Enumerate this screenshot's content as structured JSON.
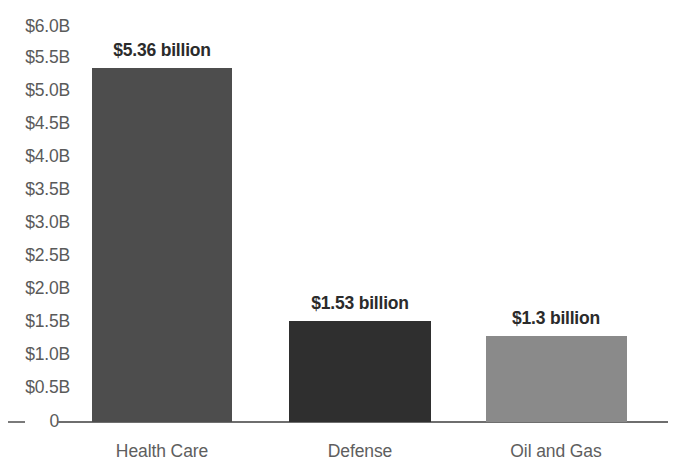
{
  "chart_data": {
    "type": "bar",
    "title": "",
    "xlabel": "",
    "ylabel": "",
    "categories": [
      "Health Care",
      "Defense",
      "Oil and Gas"
    ],
    "values": [
      5.36,
      1.53,
      1.3
    ],
    "value_labels": [
      "$5.36 billion",
      "$1.53 billion",
      "$1.3 billion"
    ],
    "bar_colors": [
      "#4d4d4d",
      "#2f2f2f",
      "#8a8a8a"
    ],
    "ylim": [
      0,
      6.0
    ],
    "ytick_values": [
      6.0,
      5.5,
      5.0,
      4.5,
      4.0,
      3.5,
      3.0,
      2.5,
      2.0,
      1.5,
      1.0,
      0.5,
      0
    ],
    "ytick_labels": [
      "$6.0B",
      "$5.5B",
      "$5.0B",
      "$4.5B",
      "$4.0B",
      "$3.5B",
      "$3.0B",
      "$2.5B",
      "$2.0B",
      "$1.5B",
      "$1.0B",
      "$0.5B",
      "0"
    ],
    "grid": false,
    "legend": "none",
    "units": "billions of US dollars",
    "axis_color": "#6e6e6e",
    "tick_label_color": "#5a5a5a",
    "category_label_color": "#5e5e5e",
    "value_label_color": "#2b2b2b",
    "background": "#ffffff"
  }
}
